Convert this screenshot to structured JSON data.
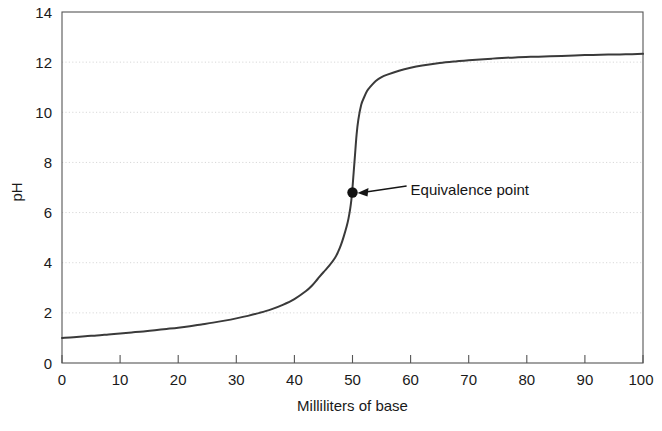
{
  "chart_data": {
    "type": "line",
    "title": "",
    "xlabel": "Milliliters of base",
    "ylabel": "pH",
    "xlim": [
      0,
      100
    ],
    "ylim": [
      0,
      14
    ],
    "xticks": [
      0,
      10,
      20,
      30,
      40,
      50,
      60,
      70,
      80,
      90,
      100
    ],
    "yticks": [
      0,
      2,
      4,
      6,
      8,
      10,
      12,
      14
    ],
    "xtick_labels": [
      "0",
      "10",
      "20",
      "30",
      "40",
      "50",
      "60",
      "70",
      "80",
      "90",
      "100"
    ],
    "ytick_labels": [
      "0",
      "2",
      "4",
      "6",
      "8",
      "10",
      "12",
      "14"
    ],
    "grid": "horizontal-dotted",
    "legend": "none",
    "series": [
      {
        "name": "Titration curve",
        "color": "#3a3a3a",
        "x": [
          0,
          2,
          4,
          6,
          8,
          10,
          12,
          14,
          16,
          18,
          20,
          22,
          24,
          26,
          28,
          30,
          32,
          34,
          36,
          38,
          40,
          42,
          43,
          44,
          45,
          46,
          47,
          47.5,
          48,
          48.5,
          49,
          49.3,
          49.6,
          49.8,
          49.9,
          50,
          50.1,
          50.2,
          50.4,
          50.7,
          51,
          51.5,
          52,
          52.5,
          53,
          54,
          55,
          56,
          58,
          60,
          62,
          65,
          68,
          70,
          74,
          78,
          82,
          86,
          90,
          94,
          97,
          100
        ],
        "y": [
          1.0,
          1.03,
          1.07,
          1.1,
          1.14,
          1.18,
          1.22,
          1.26,
          1.31,
          1.36,
          1.41,
          1.47,
          1.54,
          1.61,
          1.69,
          1.78,
          1.88,
          2.0,
          2.14,
          2.32,
          2.55,
          2.87,
          3.08,
          3.35,
          3.62,
          3.88,
          4.2,
          4.42,
          4.7,
          5.05,
          5.45,
          5.75,
          6.15,
          6.5,
          6.75,
          7.0,
          7.3,
          7.6,
          8.2,
          9.1,
          9.7,
          10.3,
          10.6,
          10.85,
          11.0,
          11.25,
          11.4,
          11.5,
          11.66,
          11.78,
          11.87,
          11.97,
          12.04,
          12.08,
          12.14,
          12.19,
          12.22,
          12.25,
          12.28,
          12.3,
          12.31,
          12.33
        ]
      }
    ],
    "annotations": [
      {
        "label": "Equivalence point",
        "point_x": 50,
        "point_y": 6.8,
        "marker": "filled-circle",
        "marker_color": "#111111",
        "text_x": 60,
        "text_y": 6.9,
        "arrow": "line-with-arrowhead"
      }
    ]
  },
  "axes": {
    "frame_color": "#555555",
    "gridline_color": "#d8d8d8",
    "background": "#ffffff"
  }
}
